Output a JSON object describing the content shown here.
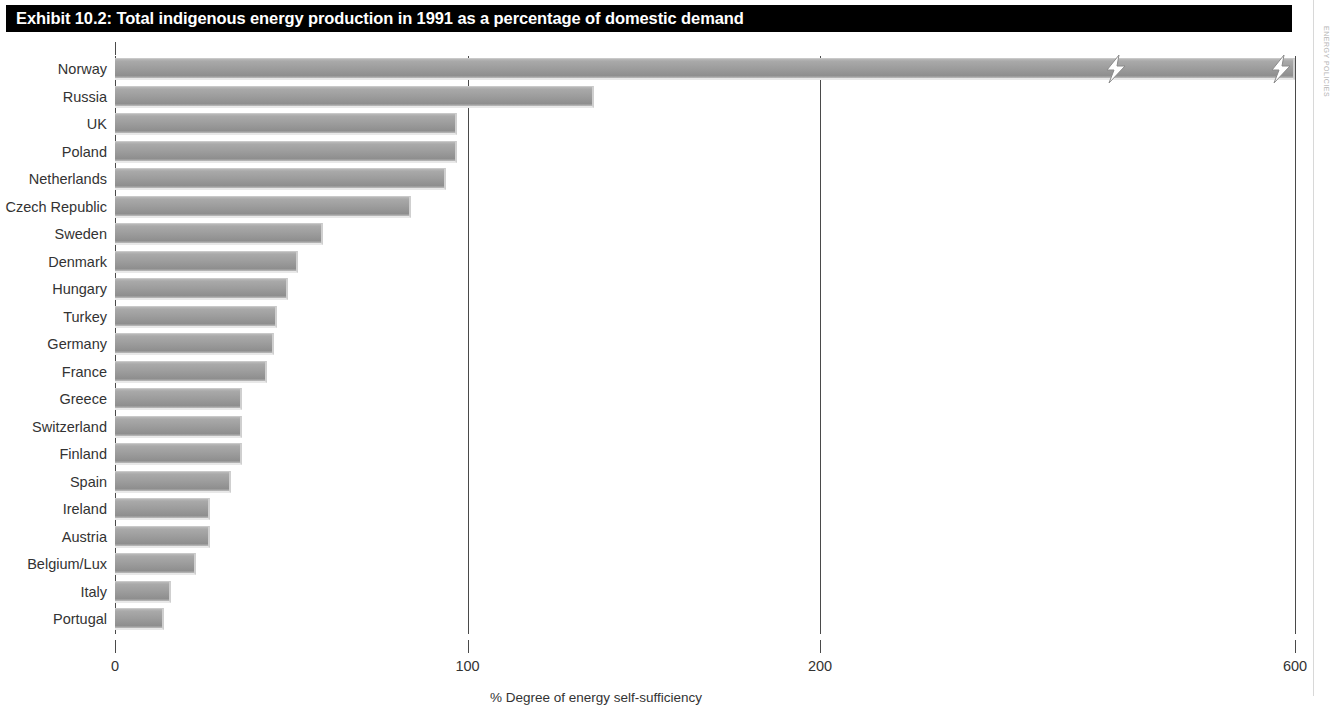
{
  "title": "Exhibit 10.2: Total indigenous energy production in 1991 as a percentage of domestic demand",
  "margin_note": "ENERGY POLICIES",
  "axis": {
    "x_title": "% Degree of energy self-sufficiency",
    "ticks": [
      "0",
      "100",
      "200",
      "600"
    ]
  },
  "colors": {
    "title_bar": "#000000",
    "title_text": "#ffffff",
    "bar_fill": "#9e9e9e",
    "axis": "#4a4a4a",
    "text": "#333333"
  },
  "chart_data": {
    "type": "bar",
    "orientation": "horizontal",
    "title": "Exhibit 10.2: Total indigenous energy production in 1991 as a percentage of domestic demand",
    "xlabel": "% Degree of energy self-sufficiency",
    "ylabel": "",
    "xlim": [
      0,
      600
    ],
    "axis_break": true,
    "axis_break_note": "Norway bar is broken; x-axis jumps from ~200 to 600",
    "grid": true,
    "gridlines": [
      0,
      100,
      200,
      600
    ],
    "legend": null,
    "categories": [
      "Norway",
      "Russia",
      "UK",
      "Poland",
      "Netherlands",
      "Czech Republic",
      "Sweden",
      "Denmark",
      "Hungary",
      "Turkey",
      "Germany",
      "France",
      "Greece",
      "Switzerland",
      "Finland",
      "Spain",
      "Ireland",
      "Austria",
      "Belgium/Lux",
      "Italy",
      "Portugal"
    ],
    "values": [
      600,
      136,
      97,
      97,
      94,
      84,
      59,
      52,
      49,
      46,
      45,
      43,
      36,
      36,
      36,
      33,
      27,
      27,
      23,
      16,
      14
    ]
  }
}
